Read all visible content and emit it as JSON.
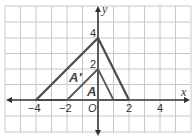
{
  "graph": {
    "x_axis_label": "x",
    "y_axis_label": "y",
    "origin_label": "O",
    "x_tick_labels": [
      {
        "value": -4,
        "text": "−4"
      },
      {
        "value": -2,
        "text": "−2"
      },
      {
        "value": 2,
        "text": "2"
      },
      {
        "value": 4,
        "text": "4"
      }
    ],
    "y_tick_labels": [
      {
        "value": 4,
        "text": "4"
      },
      {
        "value": 2,
        "text": "2"
      }
    ],
    "triangles": [
      {
        "name": "A′",
        "vertices": [
          [
            -4,
            0
          ],
          [
            0,
            4
          ],
          [
            2,
            0
          ]
        ],
        "color": "#4a4a4a"
      },
      {
        "name": "A",
        "vertices": [
          [
            -2,
            0
          ],
          [
            0,
            2
          ],
          [
            1,
            0
          ]
        ],
        "color": "#5a5a5a"
      }
    ],
    "grid": {
      "xmin": -6,
      "xmax": 6,
      "ymin": -2,
      "ymax": 6
    },
    "colors": {
      "grid": "#c8c8c8",
      "axis": "#333333"
    }
  }
}
